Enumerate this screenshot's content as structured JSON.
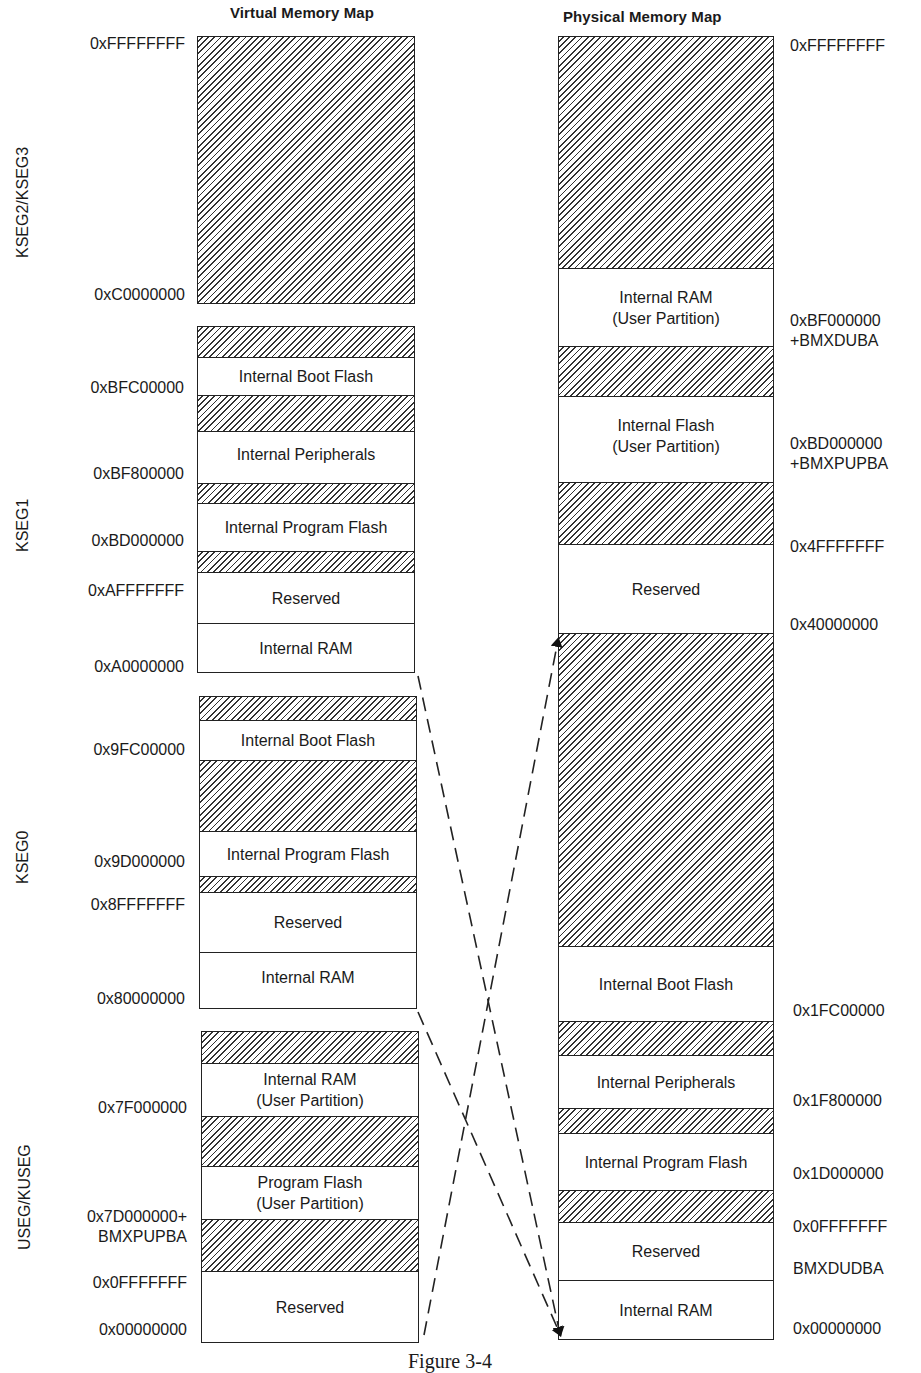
{
  "virtual": {
    "title": "Virtual Memory Map",
    "segments": [
      {
        "name": "KSEG2/KSEG3",
        "regions": [
          {
            "label": "",
            "hatched": true
          }
        ],
        "addresses": [
          "0xFFFFFFFF",
          "0xC0000000"
        ]
      },
      {
        "name": "KSEG1",
        "regions": [
          {
            "label": "",
            "hatched": true
          },
          {
            "label": "Internal Boot Flash",
            "hatched": false
          },
          {
            "label": "",
            "hatched": true
          },
          {
            "label": "Internal Peripherals",
            "hatched": false
          },
          {
            "label": "",
            "hatched": true
          },
          {
            "label": "Internal Program Flash",
            "hatched": false
          },
          {
            "label": "",
            "hatched": true
          },
          {
            "label": "Reserved",
            "hatched": false
          },
          {
            "label": "Internal RAM",
            "hatched": false
          }
        ],
        "addresses": [
          "0xBFC00000",
          "0xBF800000",
          "0xBD000000",
          "0xAFFFFFFF",
          "0xA0000000"
        ]
      },
      {
        "name": "KSEG0",
        "regions": [
          {
            "label": "",
            "hatched": true
          },
          {
            "label": "Internal Boot Flash",
            "hatched": false
          },
          {
            "label": "",
            "hatched": true
          },
          {
            "label": "Internal Program Flash",
            "hatched": false
          },
          {
            "label": "",
            "hatched": true
          },
          {
            "label": "Reserved",
            "hatched": false
          },
          {
            "label": "Internal RAM",
            "hatched": false
          }
        ],
        "addresses": [
          "0x9FC00000",
          "0x9D000000",
          "0x8FFFFFFF",
          "0x80000000"
        ]
      },
      {
        "name": "USEG/KUSEG",
        "regions": [
          {
            "label": "",
            "hatched": true
          },
          {
            "label": "Internal RAM\n(User Partition)",
            "hatched": false
          },
          {
            "label": "",
            "hatched": true
          },
          {
            "label": "Program Flash\n(User Partition)",
            "hatched": false
          },
          {
            "label": "",
            "hatched": true
          },
          {
            "label": "Reserved",
            "hatched": false
          }
        ],
        "addresses": [
          "0x7F000000",
          "0x7D000000+\nBMXPUPBA",
          "0x0FFFFFFF",
          "0x00000000"
        ]
      }
    ]
  },
  "physical": {
    "title": "Physical Memory Map",
    "regions": [
      {
        "label": "",
        "hatched": true
      },
      {
        "label": "Internal RAM\n(User Partition)",
        "hatched": false
      },
      {
        "label": "",
        "hatched": true
      },
      {
        "label": "Internal Flash\n(User Partition)",
        "hatched": false
      },
      {
        "label": "",
        "hatched": true
      },
      {
        "label": "Reserved",
        "hatched": false
      },
      {
        "label": "",
        "hatched": true
      },
      {
        "label": "Internal Boot Flash",
        "hatched": false
      },
      {
        "label": "",
        "hatched": true
      },
      {
        "label": "Internal Peripherals",
        "hatched": false
      },
      {
        "label": "",
        "hatched": true
      },
      {
        "label": "Internal Program Flash",
        "hatched": false
      },
      {
        "label": "",
        "hatched": true
      },
      {
        "label": "Reserved",
        "hatched": false
      },
      {
        "label": "Internal RAM",
        "hatched": false
      }
    ],
    "addresses": [
      "0xFFFFFFFF",
      "0xBF000000\n+BMXDUBA",
      "0xBD000000\n+BMXPUPBA",
      "0x4FFFFFFF",
      "0x40000000",
      "0x1FC00000",
      "0x1F800000",
      "0x1D000000",
      "0x0FFFFFFF",
      "BMXDUDBA",
      "0x00000000"
    ]
  },
  "mappings": [
    {
      "from": "KSEG1",
      "to": "Physical 0x00000000 (bottom)"
    },
    {
      "from": "KSEG0",
      "to": "Physical 0x00000000 (bottom)"
    },
    {
      "from": "USEG/KUSEG",
      "to": "Physical 0x40000000"
    }
  ],
  "caption": "Figure 3-4"
}
